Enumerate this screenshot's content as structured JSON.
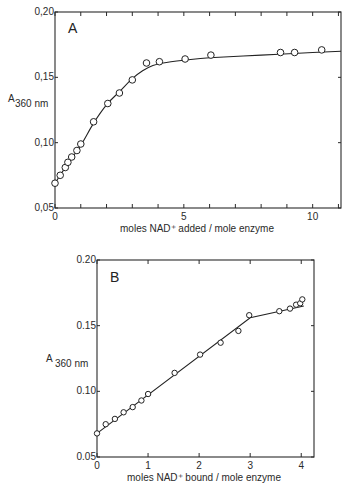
{
  "chart_data": [
    {
      "type": "line",
      "panel_label": "A",
      "title": "",
      "xlabel": "moles NAD⁺ added / mole enzyme",
      "ylabel_main": "A",
      "ylabel_sub": "360 nm",
      "xlim": [
        0,
        11.1
      ],
      "ylim": [
        0.05,
        0.2
      ],
      "xticks": [
        0,
        1,
        2,
        3,
        4,
        5,
        6,
        7,
        8,
        9,
        10,
        11
      ],
      "xtick_labels": [
        {
          "value": 0,
          "label": "0"
        },
        {
          "value": 5,
          "label": "5"
        },
        {
          "value": 10,
          "label": "10"
        }
      ],
      "yticks": [
        0.05,
        0.1,
        0.15,
        0.2
      ],
      "ytick_labels": [
        {
          "value": 0.05,
          "label": "0,05"
        },
        {
          "value": 0.1,
          "label": "0,10"
        },
        {
          "value": 0.15,
          "label": "0,15"
        },
        {
          "value": 0.2,
          "label": "0,20"
        }
      ],
      "grid": false,
      "points": {
        "x": [
          0,
          0.2,
          0.4,
          0.5,
          0.65,
          0.85,
          1.0,
          1.5,
          2.05,
          2.5,
          3.0,
          3.55,
          4.05,
          5.05,
          6.05,
          8.75,
          9.3,
          10.35
        ],
        "y": [
          0.069,
          0.075,
          0.081,
          0.085,
          0.089,
          0.094,
          0.099,
          0.116,
          0.13,
          0.138,
          0.148,
          0.161,
          0.162,
          0.164,
          0.167,
          0.169,
          0.169,
          0.171
        ]
      },
      "curve": {
        "x": [
          0,
          0.5,
          1.0,
          1.5,
          2.0,
          2.5,
          3.0,
          3.4,
          3.8,
          4.2,
          5.0,
          6.0,
          8.0,
          10.0,
          11.1
        ],
        "y": [
          0.069,
          0.084,
          0.098,
          0.115,
          0.129,
          0.139,
          0.149,
          0.155,
          0.159,
          0.161,
          0.163,
          0.165,
          0.167,
          0.169,
          0.17
        ]
      }
    },
    {
      "type": "line",
      "panel_label": "B",
      "title": "",
      "xlabel": "moles NAD⁺ bound / mole enzyme",
      "ylabel_main": "A",
      "ylabel_sub": "360 nm",
      "xlim": [
        0,
        4.25
      ],
      "ylim": [
        0.05,
        0.2
      ],
      "xticks": [
        0,
        1,
        2,
        3,
        4
      ],
      "xtick_labels": [
        {
          "value": 0,
          "label": "0"
        },
        {
          "value": 1,
          "label": "1"
        },
        {
          "value": 2,
          "label": "2"
        },
        {
          "value": 3,
          "label": "3"
        },
        {
          "value": 4,
          "label": "4"
        }
      ],
      "yticks": [
        0.05,
        0.1,
        0.15,
        0.2
      ],
      "ytick_labels": [
        {
          "value": 0.05,
          "label": "0.05"
        },
        {
          "value": 0.1,
          "label": "0.10"
        },
        {
          "value": 0.15,
          "label": "0.15"
        },
        {
          "value": 0.2,
          "label": "0.20"
        }
      ],
      "grid": false,
      "points": {
        "x": [
          0,
          0.17,
          0.35,
          0.52,
          0.7,
          0.87,
          1.0,
          1.52,
          2.02,
          2.42,
          2.77,
          2.98,
          3.57,
          3.78,
          3.9,
          3.98,
          4.02
        ],
        "y": [
          0.068,
          0.075,
          0.079,
          0.084,
          0.088,
          0.093,
          0.098,
          0.114,
          0.128,
          0.137,
          0.146,
          0.158,
          0.161,
          0.163,
          0.166,
          0.167,
          0.17
        ]
      },
      "curve": {
        "x": [
          0,
          3.0,
          4.05
        ],
        "y": [
          0.068,
          0.156,
          0.165
        ]
      }
    }
  ]
}
